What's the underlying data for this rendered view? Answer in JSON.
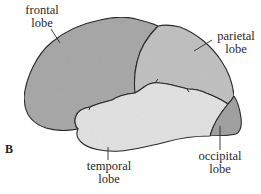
{
  "figure": {
    "panel_label": "B",
    "lobes": [
      {
        "id": "frontal",
        "label_line1": "frontal",
        "label_line2": "lobe",
        "fill": "#a9a9a9"
      },
      {
        "id": "parietal",
        "label_line1": "parietal",
        "label_line2": "lobe",
        "fill": "#c2c2c2"
      },
      {
        "id": "temporal",
        "label_line1": "temporal",
        "label_line2": "lobe",
        "fill": "#e3e3e3"
      },
      {
        "id": "occipital",
        "label_line1": "occipital",
        "label_line2": "lobe",
        "fill": "#a3a3a3"
      }
    ],
    "outline_color": "#2b2b2b"
  }
}
